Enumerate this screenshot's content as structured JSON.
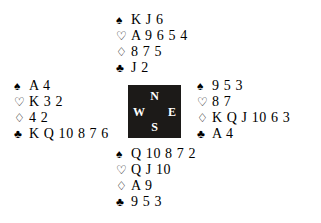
{
  "diagram": {
    "kind": "bridge-deal-diagram",
    "background_color": "#ffffff",
    "ink_color": "#000000"
  },
  "suits": {
    "spade": {
      "name": "spade-symbol",
      "glyph": "♠",
      "filled": true
    },
    "heart": {
      "name": "heart-symbol",
      "glyph": "♡",
      "filled": false
    },
    "diamond": {
      "name": "diamond-symbol",
      "glyph": "♢",
      "filled": false
    },
    "club": {
      "name": "club-symbol",
      "glyph": "♣",
      "filled": true
    }
  },
  "compass": {
    "box_color": "#1c1a18",
    "label_color": "#ffffff",
    "north": "N",
    "west": "W",
    "east": "E",
    "south": "S"
  },
  "hands": {
    "north": {
      "position": "North",
      "spades": "K J 6",
      "hearts": "A 9 6 5 4",
      "diamonds": "8 7 5",
      "clubs": "J 2"
    },
    "west": {
      "position": "West",
      "spades": "A 4",
      "hearts": "K 3 2",
      "diamonds": "4 2",
      "clubs": "K Q 10 8 7 6"
    },
    "east": {
      "position": "East",
      "spades": "9 5 3",
      "hearts": "8 7",
      "diamonds": "K Q J 10 6 3",
      "clubs": "A 4"
    },
    "south": {
      "position": "South",
      "spades": "Q 10 8 7 2",
      "hearts": "Q J 10",
      "diamonds": "A 9",
      "clubs": "9 5 3"
    }
  }
}
